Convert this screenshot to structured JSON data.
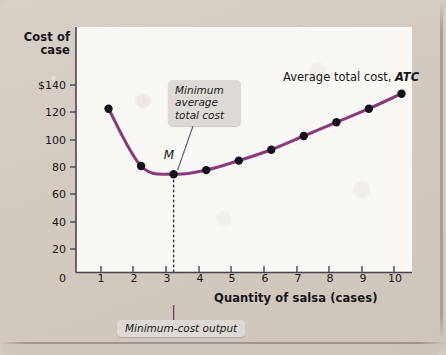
{
  "figure": {
    "background_color": "#d4cbc2",
    "plot_background_color": "#faf8f5"
  },
  "axes": {
    "y_title_line1": "Cost of",
    "y_title_line2": "case",
    "x_title": "Quantity of salsa (cases)",
    "y_ticks": [
      "$140",
      "120",
      "100",
      "80",
      "60",
      "40",
      "20"
    ],
    "y_origin": "0",
    "x_ticks": [
      "1",
      "2",
      "3",
      "4",
      "5",
      "6",
      "7",
      "8",
      "9",
      "10"
    ]
  },
  "annotations": {
    "minimum_point_label": "M",
    "callout_minimum": "Minimum average total cost",
    "callout_minimum_lines": [
      "Minimum",
      "average",
      "total cost"
    ],
    "callout_output": "Minimum-cost output",
    "series_label_text": "Average total cost,",
    "series_label_italic": "ATC"
  },
  "colors": {
    "curve": "#8b3a7c",
    "marker": "#15131a",
    "callout_bg": "#dedad6",
    "dotted_line": "#3a3740"
  },
  "chart_data": {
    "type": "line",
    "title": "",
    "xlabel": "Quantity of salsa (cases)",
    "ylabel": "Cost of case",
    "xlim": [
      0,
      10.6
    ],
    "ylim": [
      0,
      152
    ],
    "grid": false,
    "legend": "inline-series-label",
    "x": [
      1,
      2,
      3,
      4,
      5,
      6,
      7,
      8,
      9,
      10
    ],
    "series": [
      {
        "name": "Average total cost, ATC",
        "color": "#8b3a7c",
        "values": [
          120,
          78,
          72,
          75,
          82,
          90,
          100,
          110,
          120,
          131
        ]
      }
    ],
    "markers": true,
    "annotated_points": [
      {
        "label": "M",
        "x": 3,
        "y": 72,
        "note": "minimum average total cost"
      }
    ],
    "reference_lines": [
      {
        "orientation": "vertical",
        "x": 3,
        "style": "dotted",
        "label": "Minimum-cost output"
      }
    ]
  }
}
